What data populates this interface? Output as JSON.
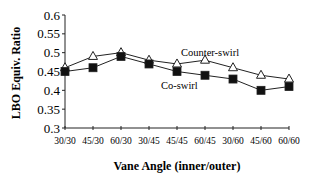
{
  "chart_data": {
    "type": "line",
    "title": "",
    "xlabel": "Vane Angle (inner/outer)",
    "ylabel": "LBO Equiv. Ratio",
    "categories": [
      "30/30",
      "45/30",
      "60/30",
      "30/45",
      "45/45",
      "60/45",
      "30/60",
      "45/60",
      "60/60"
    ],
    "y_ticks": [
      "0.6",
      "0.55",
      "0.5",
      "0.45",
      "0.4",
      "0.35",
      "0.3"
    ],
    "ylim": [
      0.3,
      0.6
    ],
    "grid": false,
    "legend_position": "inline labels near lines",
    "series": [
      {
        "name": "Counter-swirl",
        "marker": "open-triangle",
        "values": [
          0.46,
          0.49,
          0.5,
          0.48,
          0.47,
          0.48,
          0.46,
          0.44,
          0.43
        ]
      },
      {
        "name": "Co-swirl",
        "marker": "filled-square",
        "values": [
          0.45,
          0.46,
          0.49,
          0.47,
          0.45,
          0.44,
          0.43,
          0.4,
          0.41
        ]
      }
    ]
  },
  "colors": {
    "line": "#222222",
    "marker_fill_open": "#ffffff",
    "marker_fill_solid": "#111111"
  }
}
